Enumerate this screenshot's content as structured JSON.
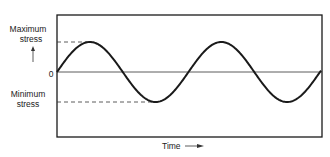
{
  "diagram": {
    "type": "sinusoidal stress-time diagram",
    "labels": {
      "max_line1": "Maximum",
      "max_line2": "stress",
      "zero": "0",
      "min_line1": "Minimum",
      "min_line2": "stress",
      "x_axis": "Time"
    },
    "curve": {
      "shape": "sine",
      "cycles_shown": 2,
      "starts_at": "zero, rising"
    },
    "colors": {
      "stroke": "#1a1a1a",
      "background": "#ffffff"
    }
  }
}
